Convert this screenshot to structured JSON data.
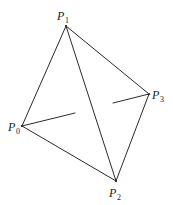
{
  "diagram": {
    "vertices": [
      {
        "id": "P0",
        "label": "P",
        "sub": "0",
        "x": 22,
        "y": 126,
        "lx": 8,
        "ly": 131,
        "sx": 16,
        "sy": 134
      },
      {
        "id": "P1",
        "label": "P",
        "sub": "1",
        "x": 66,
        "y": 26,
        "lx": 57,
        "ly": 20,
        "sx": 65,
        "sy": 23
      },
      {
        "id": "P2",
        "label": "P",
        "sub": "2",
        "x": 116,
        "y": 181,
        "lx": 109,
        "ly": 197,
        "sx": 117,
        "sy": 200
      },
      {
        "id": "P3",
        "label": "P",
        "sub": "3",
        "x": 149,
        "y": 94,
        "lx": 152,
        "ly": 99,
        "sx": 160,
        "sy": 102
      }
    ],
    "visible_edges": [
      {
        "from": "P0",
        "to": "P1"
      },
      {
        "from": "P1",
        "to": "P3"
      },
      {
        "from": "P1",
        "to": "P2"
      },
      {
        "from": "P0",
        "to": "P2"
      },
      {
        "from": "P3",
        "to": "P2"
      }
    ],
    "hidden_edge": {
      "from": "P0",
      "to": "P3",
      "segments": [
        {
          "x1": 22,
          "y1": 126,
          "x2": 75,
          "y2": 113
        },
        {
          "x1": 113,
          "y1": 103,
          "x2": 149,
          "y2": 94
        }
      ]
    },
    "colors": {
      "stroke": "#2a2a2a",
      "text": "#1a1a1a",
      "background": "#ffffff"
    }
  }
}
